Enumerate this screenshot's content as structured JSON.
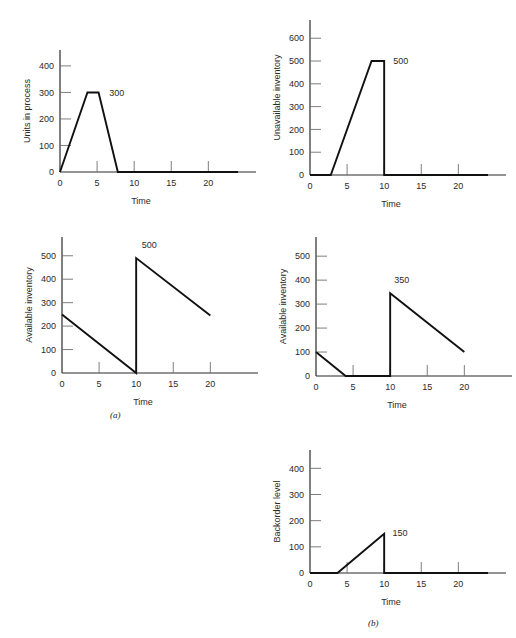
{
  "figure": {
    "background": "#ffffff",
    "line_color": "#111111",
    "axis_color": "#2b2b2b",
    "tick_color": "#6f6f6f",
    "group_labels": [
      {
        "name": "group-label-a",
        "text": "(a)"
      },
      {
        "name": "group-label-b",
        "text": "(b)"
      }
    ]
  },
  "chart_data": [
    {
      "id": "units-in-process",
      "type": "line",
      "title": "",
      "xlabel": "Time",
      "ylabel": "Units in process",
      "xlim": [
        0,
        24
      ],
      "ylim": [
        0,
        460
      ],
      "xticks": [
        0,
        5,
        10,
        15,
        20
      ],
      "xtick_labels": [
        "0",
        "5",
        "10",
        "15",
        "20"
      ],
      "yticks": [
        0,
        100,
        200,
        300,
        400
      ],
      "ytick_labels": [
        "0",
        "100",
        "200",
        "300",
        "400"
      ],
      "grid": false,
      "legend": "none",
      "points": [
        {
          "x": 0,
          "y": 0
        },
        {
          "x": 3.7,
          "y": 300
        },
        {
          "x": 5.2,
          "y": 300
        },
        {
          "x": 7.8,
          "y": 0
        },
        {
          "x": 24,
          "y": 0
        }
      ],
      "annotations": [
        {
          "text": "300",
          "x": 6.1,
          "y": 300,
          "name": "value-label-300"
        }
      ]
    },
    {
      "id": "unavailable-inventory",
      "type": "line",
      "title": "",
      "xlabel": "Time",
      "ylabel": "Unavailable inventory",
      "xlim": [
        0,
        24
      ],
      "ylim": [
        0,
        680
      ],
      "xticks": [
        0,
        5,
        10,
        15,
        20
      ],
      "xtick_labels": [
        "0",
        "5",
        "10",
        "15",
        "20"
      ],
      "yticks": [
        0,
        100,
        200,
        300,
        400,
        500,
        600
      ],
      "ytick_labels": [
        "0",
        "100",
        "200",
        "300",
        "400",
        "500",
        "600"
      ],
      "grid": false,
      "legend": "none",
      "points": [
        {
          "x": 0,
          "y": 0
        },
        {
          "x": 2.8,
          "y": 0
        },
        {
          "x": 8.3,
          "y": 500
        },
        {
          "x": 10,
          "y": 500
        },
        {
          "x": 10,
          "y": 0
        },
        {
          "x": 24,
          "y": 0
        }
      ],
      "annotations": [
        {
          "text": "500",
          "x": 10.7,
          "y": 500,
          "name": "value-label-500"
        }
      ]
    },
    {
      "id": "available-inventory-a",
      "type": "line",
      "title": "",
      "xlabel": "Time",
      "ylabel": "Available inventory",
      "xlim": [
        0,
        24
      ],
      "ylim": [
        0,
        580
      ],
      "xticks": [
        0,
        5,
        10,
        15,
        20
      ],
      "xtick_labels": [
        "0",
        "5",
        "10",
        "15",
        "20"
      ],
      "yticks": [
        0,
        100,
        200,
        300,
        400,
        500
      ],
      "ytick_labels": [
        "0",
        "100",
        "200",
        "300",
        "400",
        "500"
      ],
      "grid": false,
      "legend": "none",
      "points": [
        {
          "x": 0,
          "y": 250
        },
        {
          "x": 10,
          "y": 0
        },
        {
          "x": 10,
          "y": 490
        },
        {
          "x": 20,
          "y": 245
        }
      ],
      "annotations": [
        {
          "text": "500",
          "x": 10.2,
          "y": 545,
          "name": "value-label-500"
        }
      ]
    },
    {
      "id": "available-inventory-b",
      "type": "line",
      "title": "",
      "xlabel": "Time",
      "ylabel": "Available inventory",
      "xlim": [
        0,
        24
      ],
      "ylim": [
        0,
        580
      ],
      "xticks": [
        0,
        5,
        10,
        15,
        20
      ],
      "xtick_labels": [
        "0",
        "5",
        "10",
        "15",
        "20"
      ],
      "yticks": [
        0,
        100,
        200,
        300,
        400,
        500
      ],
      "ytick_labels": [
        "0",
        "100",
        "200",
        "300",
        "400",
        "500"
      ],
      "grid": false,
      "legend": "none",
      "points": [
        {
          "x": 0,
          "y": 100
        },
        {
          "x": 4,
          "y": 0
        },
        {
          "x": 10,
          "y": 0
        },
        {
          "x": 10,
          "y": 345
        },
        {
          "x": 20,
          "y": 100
        }
      ],
      "annotations": [
        {
          "text": "350",
          "x": 10.0,
          "y": 400,
          "name": "value-label-350"
        }
      ]
    },
    {
      "id": "backorder-level",
      "type": "line",
      "title": "",
      "xlabel": "Time",
      "ylabel": "Backorder level",
      "xlim": [
        0,
        24
      ],
      "ylim": [
        0,
        470
      ],
      "xticks": [
        0,
        5,
        10,
        15,
        20
      ],
      "xtick_labels": [
        "0",
        "5",
        "10",
        "15",
        "20"
      ],
      "yticks": [
        0,
        100,
        200,
        300,
        400
      ],
      "ytick_labels": [
        "0",
        "100",
        "200",
        "300",
        "400"
      ],
      "grid": false,
      "legend": "none",
      "points": [
        {
          "x": 0,
          "y": 0
        },
        {
          "x": 3.7,
          "y": 0
        },
        {
          "x": 10,
          "y": 150
        },
        {
          "x": 10,
          "y": 0
        },
        {
          "x": 24,
          "y": 0
        }
      ],
      "annotations": [
        {
          "text": "150",
          "x": 10.6,
          "y": 155,
          "name": "value-label-150"
        }
      ]
    }
  ]
}
